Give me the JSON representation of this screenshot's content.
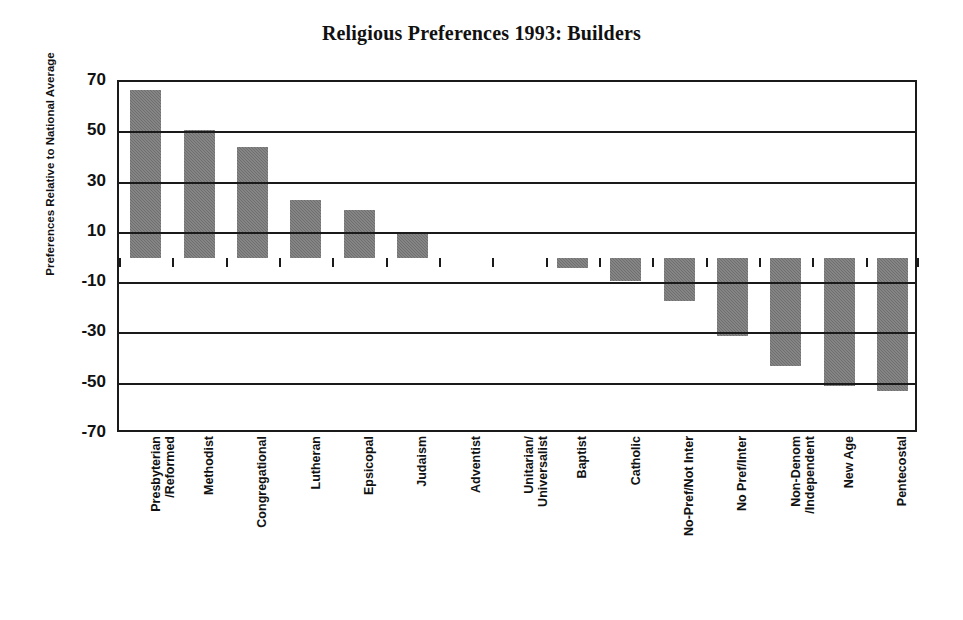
{
  "chart_data": {
    "type": "bar",
    "title": "Religious Preferences 1993: Builders",
    "xlabel": "",
    "ylabel": "Preferences Relative to National Average",
    "ylim": [
      -70,
      70
    ],
    "yticks": [
      70,
      50,
      30,
      10,
      -10,
      -30,
      -50,
      -70
    ],
    "ytick_labels": [
      "70",
      "50",
      "30",
      "10",
      "-10",
      "-30",
      "-50",
      "-70"
    ],
    "grid": true,
    "legend": "none",
    "bar_color": "#6e6e6e",
    "categories": [
      "Presbyterian\n/Reformed",
      "Methodist",
      "Congregational",
      "Lutheran",
      "Epsicopal",
      "Judaism",
      "Adventist",
      "Unitarian/\nUniversalist",
      "Baptist",
      "Catholic",
      "No-Pref/Not Inter",
      "No Pref/Inter",
      "Non-Denom\n/Independent",
      "New Age",
      "Pentecostal"
    ],
    "values": [
      67,
      51,
      44,
      23,
      19,
      10,
      0,
      0,
      -4,
      -9,
      -17,
      -31,
      -43,
      -51,
      -53
    ]
  },
  "axis": {
    "y_title": "Preferences Relative to National Average"
  }
}
